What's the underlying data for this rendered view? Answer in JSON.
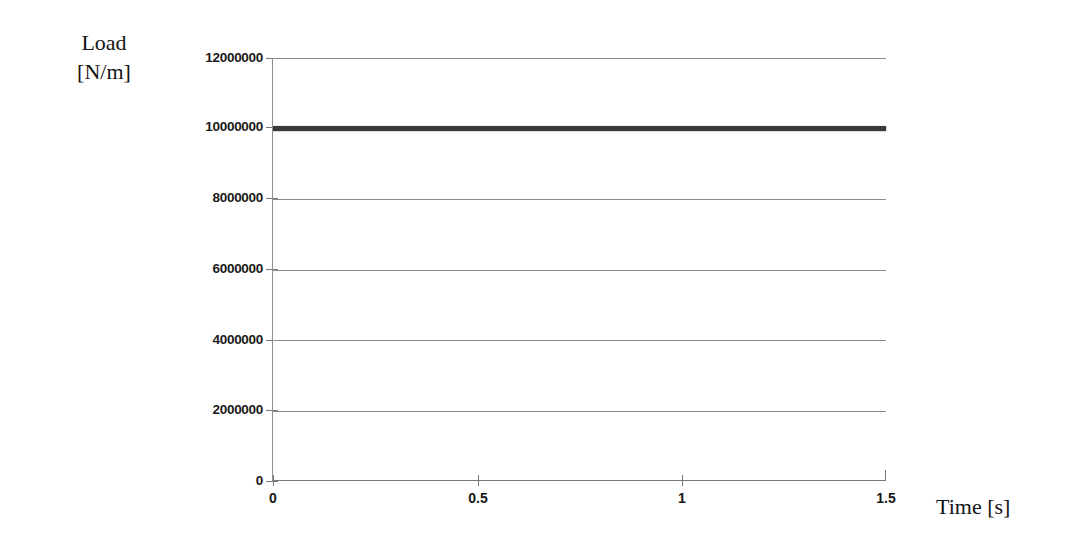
{
  "chart_data": {
    "type": "line",
    "title": "",
    "xlabel": "Time [s]",
    "ylabel": "Load [N/m]",
    "ylabel_lines": [
      "Load",
      "[N/m]"
    ],
    "xlim": [
      0,
      1.5
    ],
    "ylim": [
      0,
      12000000
    ],
    "grid": "horizontal",
    "legend": "none",
    "x_ticks": [
      0,
      0.5,
      1,
      1.5
    ],
    "x_tick_labels": [
      "0",
      "0.5",
      "1",
      "1.5"
    ],
    "y_ticks": [
      0,
      2000000,
      4000000,
      6000000,
      8000000,
      10000000,
      12000000
    ],
    "y_tick_labels": [
      "0",
      "2000000",
      "4000000",
      "6000000",
      "8000000",
      "10000000",
      "12000000"
    ],
    "series": [
      {
        "name": "Load",
        "color": "#3a3a3a",
        "line_width": 5,
        "x": [
          0,
          0.5,
          1,
          1.5
        ],
        "values": [
          10000000,
          10000000,
          10000000,
          10000000
        ]
      }
    ],
    "colors": {
      "background": "#ffffff",
      "gridline": "#8a8a8a",
      "axis": "#787878",
      "text": "#141414",
      "series": "#3a3a3a"
    }
  }
}
